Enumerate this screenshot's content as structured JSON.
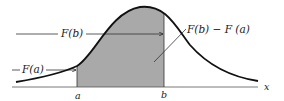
{
  "figure": {
    "colors": {
      "curve": "#111111",
      "shade": "#a9a9a9",
      "axis": "#333333",
      "text": "#1a1a1a"
    },
    "labels": {
      "F_b": "F(b)",
      "F_a": "F(a)",
      "difference": "F(b) − F (a)",
      "a": "a",
      "b": "b",
      "x_axis": "x"
    }
  }
}
